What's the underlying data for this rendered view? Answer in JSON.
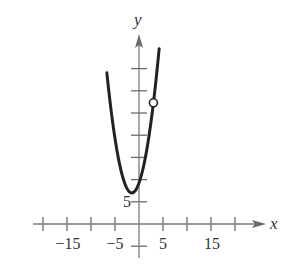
{
  "chart_data": {
    "type": "line",
    "title": "",
    "xlabel": "x",
    "ylabel": "y",
    "x_tick_labels": [
      "-15",
      "-5",
      "5",
      "15"
    ],
    "y_tick_labels": [
      "5"
    ],
    "x_ticks": [
      -20,
      -15,
      -10,
      -5,
      5,
      10,
      15,
      20
    ],
    "y_ticks": [
      -5,
      5,
      10,
      15,
      20,
      25,
      30,
      35
    ],
    "xlim": [
      -24,
      26
    ],
    "ylim": [
      -8,
      42
    ],
    "grid": false,
    "legend": null,
    "series": [
      {
        "name": "f(x)",
        "description": "upward-opening parabola, vertex near (-1.5, 7)",
        "x": [
          -6.7,
          -6,
          -5,
          -4,
          -3,
          -2,
          -1.5,
          -1,
          0,
          1,
          2,
          3,
          4,
          4.2
        ],
        "y": [
          34.0,
          27.3,
          19.3,
          13.3,
          9.3,
          7.3,
          7.0,
          7.3,
          9.3,
          13.3,
          19.3,
          27.3,
          37.3,
          39.5
        ]
      }
    ],
    "annotations": [
      {
        "type": "open-circle",
        "x": 3,
        "y": 27.3,
        "meaning": "removable discontinuity (hole)"
      }
    ]
  },
  "labels": {
    "x_axis": "x",
    "y_axis": "y",
    "xt1": "−15",
    "xt2": "−5",
    "xt3": "5",
    "xt4": "15",
    "yt1": "5"
  }
}
